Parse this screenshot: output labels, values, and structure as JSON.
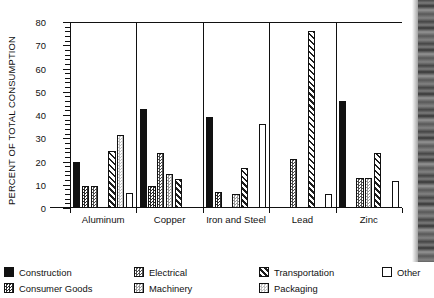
{
  "chart_data": {
    "type": "bar",
    "title": "",
    "xlabel": "",
    "ylabel": "PERCENT OF TOTAL CONSUMPTION",
    "ylim": [
      0,
      80
    ],
    "ytick_labels": [
      "0",
      "10",
      "20",
      "30",
      "40",
      "50",
      "60",
      "70",
      "80"
    ],
    "ytick_values": [
      0,
      10,
      20,
      30,
      40,
      50,
      60,
      70,
      80
    ],
    "ytick_step": 10,
    "minor_tick_step": 2,
    "grid": false,
    "legend_position": "bottom",
    "group_dividers": true,
    "categories": [
      "Aluminum",
      "Copper",
      "Iron and Steel",
      "Lead",
      "Zinc"
    ],
    "series": [
      {
        "name": "Construction",
        "swatch": "sw-construction",
        "color": "#111111",
        "values": [
          20,
          42.5,
          39,
          null,
          46
        ]
      },
      {
        "name": "Consumer Goods",
        "swatch": "sw-consumer-goods",
        "color": "#2a2a2a",
        "values": [
          9.5,
          9.5,
          7,
          null,
          null
        ]
      },
      {
        "name": "Electrical",
        "swatch": "sw-electrical",
        "color": "#4d4d4d",
        "values": [
          9.5,
          23.5,
          null,
          21,
          13
        ]
      },
      {
        "name": "Machinery",
        "swatch": "sw-machinery",
        "color": "#9a9a9a",
        "values": [
          null,
          14.5,
          6,
          null,
          13
        ]
      },
      {
        "name": "Transportation",
        "swatch": "sw-transportation",
        "color": "#1d1d1d",
        "values": [
          24.5,
          12.5,
          17,
          76,
          23.5
        ]
      },
      {
        "name": "Packaging",
        "swatch": "sw-packaging",
        "color": "#c2c2c2",
        "values": [
          31.5,
          null,
          null,
          null,
          null
        ]
      },
      {
        "name": "Other",
        "swatch": "sw-other",
        "color": "#ffffff",
        "values": [
          6.5,
          null,
          36,
          6,
          11.5
        ]
      }
    ]
  },
  "legend": {
    "columns": [
      {
        "left": 0,
        "items": [
          "Construction",
          "Consumer Goods"
        ]
      },
      {
        "left": 130,
        "items": [
          "Electrical",
          "Machinery"
        ]
      },
      {
        "left": 255,
        "items": [
          "Transportation",
          "Packaging"
        ]
      },
      {
        "left": 378,
        "items": [
          "Other"
        ]
      }
    ]
  }
}
